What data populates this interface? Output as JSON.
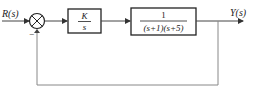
{
  "diagram": {
    "type": "block-diagram",
    "input_label": "R(s)",
    "output_label": "Y(s)",
    "summing_junction": {
      "feedback_sign": "−"
    },
    "blocks": [
      {
        "id": "controller",
        "numerator": "K",
        "denominator": "s"
      },
      {
        "id": "plant",
        "numerator": "1",
        "denominator": "(s+1)(s+5)"
      }
    ],
    "feedback": "unity negative"
  }
}
